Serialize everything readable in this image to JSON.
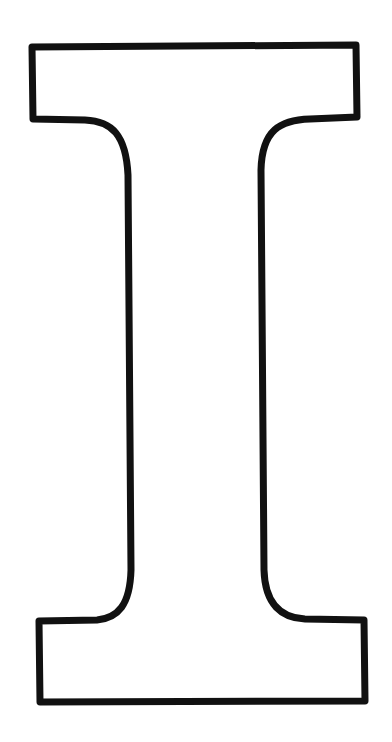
{
  "figure": {
    "letter": "I",
    "stroke_color": "#111111",
    "fill_color": "#ffffff",
    "background": "#ffffff"
  }
}
